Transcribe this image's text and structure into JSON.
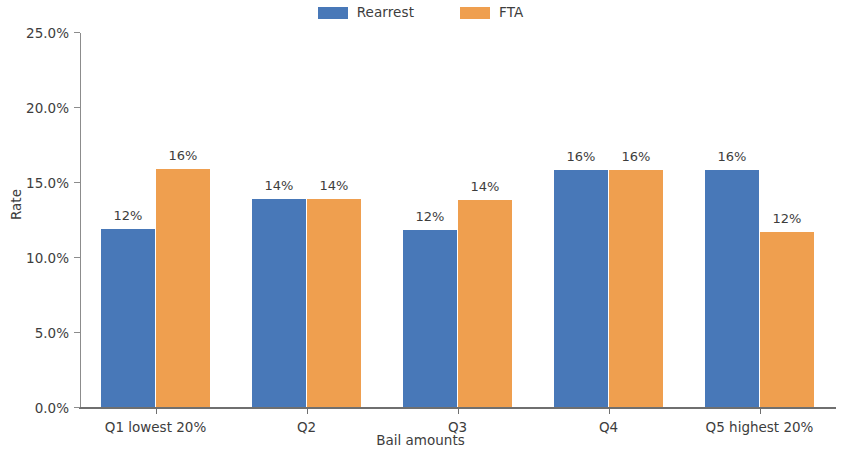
{
  "chart_data": {
    "type": "bar",
    "title": "",
    "xlabel": "Bail amounts",
    "ylabel": "Rate",
    "categories": [
      "Q1 lowest 20%",
      "Q2",
      "Q3",
      "Q4",
      "Q5 highest 20%"
    ],
    "ylim": [
      0,
      25
    ],
    "ytick_labels": [
      "0.0%",
      "5.0%",
      "10.0%",
      "15.0%",
      "20.0%",
      "25.0%"
    ],
    "ytick_values": [
      0,
      5,
      10,
      15,
      20,
      25
    ],
    "grid": false,
    "legend_position": "top-center",
    "series": [
      {
        "name": "Rearrest",
        "color": "#4878b8",
        "values": [
          11.9,
          13.9,
          11.8,
          15.8,
          15.8
        ],
        "labels": [
          "12%",
          "14%",
          "12%",
          "16%",
          "16%"
        ]
      },
      {
        "name": "FTA",
        "color": "#ef9f4f",
        "values": [
          15.9,
          13.9,
          13.8,
          15.8,
          11.7
        ],
        "labels": [
          "16%",
          "14%",
          "14%",
          "16%",
          "12%"
        ]
      }
    ]
  }
}
